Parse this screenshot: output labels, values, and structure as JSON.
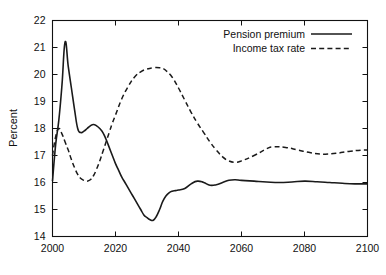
{
  "chart_data": {
    "type": "line",
    "title": "",
    "xlabel": "",
    "ylabel": "Percent",
    "xlim": [
      2000,
      2100
    ],
    "ylim": [
      14,
      22
    ],
    "xticks": [
      2000,
      2020,
      2040,
      2060,
      2080,
      2100
    ],
    "xtick_labels": [
      "2000",
      "2020",
      "2040",
      "2060",
      "2080",
      "2100"
    ],
    "yticks": [
      14,
      15,
      16,
      17,
      18,
      19,
      20,
      21,
      22
    ],
    "ytick_labels": [
      "14",
      "15",
      "16",
      "17",
      "18",
      "19",
      "20",
      "21",
      "22"
    ],
    "grid": false,
    "legend_position": "top-right",
    "series": [
      {
        "name": "Pension premium",
        "style": "solid",
        "color": "#1a1a1a",
        "x": [
          2000,
          2001,
          2002,
          2003,
          2004,
          2005,
          2006,
          2007,
          2008,
          2009,
          2010,
          2011,
          2012,
          2013,
          2014,
          2015,
          2016,
          2017,
          2018,
          2019,
          2020,
          2021,
          2022,
          2023,
          2024,
          2025,
          2026,
          2027,
          2028,
          2029,
          2030,
          2031,
          2032,
          2033,
          2034,
          2035,
          2036,
          2037,
          2038,
          2039,
          2040,
          2042,
          2044,
          2046,
          2048,
          2050,
          2052,
          2054,
          2056,
          2058,
          2060,
          2064,
          2068,
          2072,
          2076,
          2080,
          2084,
          2088,
          2092,
          2096,
          2100
        ],
        "y": [
          16.05,
          17.4,
          18.3,
          19.6,
          21.2,
          20.3,
          19.5,
          18.7,
          18.0,
          17.85,
          17.9,
          18.0,
          18.1,
          18.15,
          18.1,
          18.0,
          17.85,
          17.6,
          17.3,
          17.0,
          16.7,
          16.45,
          16.2,
          16.0,
          15.8,
          15.6,
          15.4,
          15.2,
          15.0,
          14.8,
          14.7,
          14.62,
          14.6,
          14.75,
          15.0,
          15.3,
          15.5,
          15.62,
          15.68,
          15.7,
          15.72,
          15.78,
          15.95,
          16.05,
          16.0,
          15.9,
          15.92,
          16.0,
          16.08,
          16.1,
          16.08,
          16.05,
          16.02,
          16.0,
          16.02,
          16.05,
          16.03,
          16.0,
          15.97,
          15.95,
          15.95
        ]
      },
      {
        "name": "Income tax rate",
        "style": "dashed",
        "color": "#1a1a1a",
        "x": [
          2000,
          2001,
          2002,
          2003,
          2004,
          2005,
          2006,
          2007,
          2008,
          2009,
          2010,
          2011,
          2012,
          2013,
          2014,
          2015,
          2016,
          2017,
          2018,
          2019,
          2020,
          2022,
          2024,
          2026,
          2028,
          2030,
          2032,
          2034,
          2035,
          2036,
          2038,
          2040,
          2042,
          2044,
          2046,
          2048,
          2050,
          2052,
          2054,
          2056,
          2058,
          2060,
          2064,
          2068,
          2070,
          2074,
          2078,
          2082,
          2086,
          2090,
          2094,
          2098,
          2100
        ],
        "y": [
          17.0,
          17.7,
          18.0,
          17.8,
          17.5,
          17.2,
          16.85,
          16.55,
          16.3,
          16.15,
          16.08,
          16.05,
          16.1,
          16.25,
          16.5,
          16.8,
          17.15,
          17.5,
          17.85,
          18.2,
          18.5,
          19.1,
          19.55,
          19.9,
          20.1,
          20.2,
          20.25,
          20.25,
          20.22,
          20.15,
          19.9,
          19.5,
          19.05,
          18.6,
          18.2,
          17.85,
          17.5,
          17.2,
          16.95,
          16.8,
          16.75,
          16.8,
          17.0,
          17.25,
          17.32,
          17.3,
          17.2,
          17.1,
          17.05,
          17.08,
          17.15,
          17.2,
          17.2
        ]
      }
    ]
  },
  "legend": {
    "entries": [
      {
        "label": "Pension premium",
        "style": "solid"
      },
      {
        "label": "Income tax rate",
        "style": "dashed"
      }
    ]
  }
}
